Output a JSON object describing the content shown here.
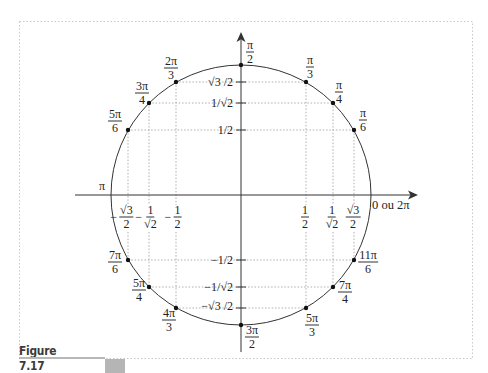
{
  "figure": {
    "caption": "Figure 7.17",
    "caption_bar_color": "#b5b5b5",
    "frame_color": "#c8c8c8"
  },
  "diagram": {
    "type": "unit-circle",
    "center_px": [
      241,
      195
    ],
    "radius_px": 130,
    "axis_color": "#333333",
    "guide_color": "#9a9a9a",
    "x_axis_end_label": "0 ou 2π",
    "angle_labels": {
      "pi_over_2": {
        "num": "π",
        "den": "2"
      },
      "pi_over_3": {
        "num": "π",
        "den": "3"
      },
      "pi_over_4": {
        "num": "π",
        "den": "4"
      },
      "pi_over_6": {
        "num": "π",
        "den": "6"
      },
      "two_pi_over_3": {
        "num": "2π",
        "den": "3"
      },
      "three_pi_over_4": {
        "num": "3π",
        "den": "4"
      },
      "five_pi_over_6": {
        "num": "5π",
        "den": "6"
      },
      "pi": "π",
      "seven_pi_over_6": {
        "num": "7π",
        "den": "6"
      },
      "five_pi_over_4": {
        "num": "5π",
        "den": "4"
      },
      "four_pi_over_3": {
        "num": "4π",
        "den": "3"
      },
      "three_pi_over_2": {
        "num": "3π",
        "den": "2"
      },
      "five_pi_over_3": {
        "num": "5π",
        "den": "3"
      },
      "seven_pi_over_4": {
        "num": "7π",
        "den": "4"
      },
      "eleven_pi_over_6": {
        "num": "11π",
        "den": "6"
      }
    },
    "y_tick_labels": {
      "sqrt3_over_2": "√3 /2",
      "one_over_sqrt2": "1/√2",
      "one_half": "1/2",
      "neg_one_half": "−1/2",
      "neg_one_over_sqrt2": "−1/√2",
      "neg_sqrt3_over_2": "−√3 /2"
    },
    "x_tick_labels": {
      "neg_sqrt3_over_2": {
        "sign": "−",
        "num": "√3",
        "den": "2"
      },
      "neg_one_over_sqrt2": {
        "sign": "−",
        "num": "1",
        "den": "√2"
      },
      "neg_one_half": {
        "sign": "−",
        "num": "1",
        "den": "2"
      },
      "one_half": {
        "num": "1",
        "den": "2"
      },
      "one_over_sqrt2": {
        "num": "1",
        "den": "√2"
      },
      "sqrt3_over_2": {
        "num": "√3",
        "den": "2"
      }
    }
  }
}
